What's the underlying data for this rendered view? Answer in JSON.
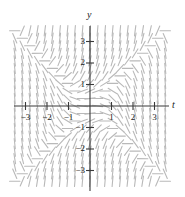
{
  "figure": {
    "name": "slope-field-plot",
    "background_color": "#ffffff",
    "axis_color": "#3a3a3a",
    "segment_color": "#b9b9b9",
    "label_color": "#1a1a1a"
  },
  "axes": {
    "x_label": "t",
    "y_label": "y",
    "x_ticks": [
      {
        "value": -3,
        "label": "−3"
      },
      {
        "value": -2,
        "label": "−2"
      },
      {
        "value": -1,
        "label": "−1"
      },
      {
        "value": 1,
        "label": "1"
      },
      {
        "value": 2,
        "label": "2"
      },
      {
        "value": 3,
        "label": "3"
      }
    ],
    "y_ticks": [
      {
        "value": 3,
        "label": "3"
      },
      {
        "value": 2,
        "label": "2"
      },
      {
        "value": 1,
        "label": "1"
      },
      {
        "value": -1,
        "label": "−1"
      },
      {
        "value": -2,
        "label": "−2"
      },
      {
        "value": -3,
        "label": "−3"
      }
    ]
  },
  "chart_data": {
    "type": "scatter",
    "subtype": "slope-field",
    "title": "",
    "xlabel": "t",
    "ylabel": "y",
    "xlim": [
      -3.5,
      3.5
    ],
    "ylim": [
      -3.5,
      3.5
    ],
    "grid": false,
    "legend": "none",
    "origin_px": {
      "x": 90,
      "y": 106
    },
    "unit_px": 21.5,
    "slope_formula": "y*y - t*t",
    "sample_range": {
      "t_min": -3.5,
      "t_max": 3.5,
      "y_min": -3.5,
      "y_max": 3.5
    },
    "sample_step": 0.35,
    "segment_half_length_px": 5.2,
    "x_ticks": [
      -3,
      -2,
      -1,
      1,
      2,
      3
    ],
    "y_ticks": [
      3,
      2,
      1,
      -1,
      -2,
      -3
    ]
  }
}
